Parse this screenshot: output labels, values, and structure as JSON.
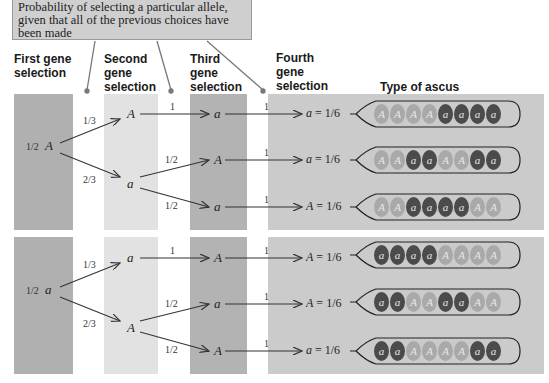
{
  "callout": {
    "text": "Probability of selecting a particular allele, given that all of the previous choices have been made"
  },
  "headers": {
    "first": "First gene selection",
    "second": "Second gene selection",
    "third": "Third gene selection",
    "fourth": "Fourth gene selection",
    "ascus": "Type of ascus"
  },
  "groups": [
    {
      "first": {
        "prob": "1/2",
        "allele": "A"
      },
      "second": [
        {
          "prob": "1/3",
          "allele": "A"
        },
        {
          "prob": "2/3",
          "allele": "a"
        }
      ],
      "rows": [
        {
          "p3": "1",
          "third": "a",
          "p4": "1",
          "fourth": "a",
          "result_prob": "1/6",
          "ascus": [
            "A",
            "A",
            "A",
            "A",
            "a",
            "a",
            "a",
            "a"
          ]
        },
        {
          "p3": "1/2",
          "third": "A",
          "p4": "1",
          "fourth": "a",
          "result_prob": "1/6",
          "ascus": [
            "A",
            "A",
            "a",
            "a",
            "A",
            "A",
            "a",
            "a"
          ]
        },
        {
          "p3": "1/2",
          "third": "a",
          "p4": "1",
          "fourth": "A",
          "result_prob": "1/6",
          "ascus": [
            "A",
            "A",
            "a",
            "a",
            "a",
            "a",
            "A",
            "A"
          ]
        }
      ]
    },
    {
      "first": {
        "prob": "1/2",
        "allele": "a"
      },
      "second": [
        {
          "prob": "1/3",
          "allele": "a"
        },
        {
          "prob": "2/3",
          "allele": "A"
        }
      ],
      "rows": [
        {
          "p3": "1",
          "third": "A",
          "p4": "1",
          "fourth": "A",
          "result_prob": "1/6",
          "ascus": [
            "a",
            "a",
            "a",
            "a",
            "A",
            "A",
            "A",
            "A"
          ]
        },
        {
          "p3": "1/2",
          "third": "a",
          "p4": "1",
          "fourth": "A",
          "result_prob": "1/6",
          "ascus": [
            "a",
            "a",
            "A",
            "A",
            "a",
            "a",
            "A",
            "A"
          ]
        },
        {
          "p3": "1/2",
          "third": "A",
          "p4": "1",
          "fourth": "a",
          "result_prob": "1/6",
          "ascus": [
            "a",
            "a",
            "A",
            "A",
            "A",
            "A",
            "a",
            "a"
          ]
        }
      ]
    }
  ],
  "colors": {
    "col1": "#b0b0b0",
    "col2": "#e2e2e2",
    "col3": "#b3b3b3",
    "panel": "#cbcbcb",
    "spore_A": "#a9a9a9",
    "spore_a": "#4b4b4b"
  }
}
